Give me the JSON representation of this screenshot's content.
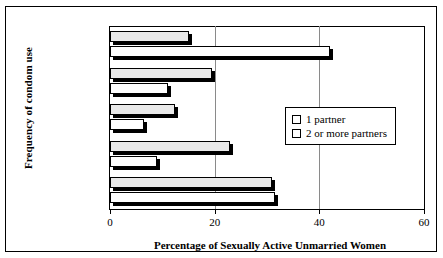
{
  "chart_data": {
    "type": "bar",
    "orientation": "horizontal",
    "title": "",
    "xlabel": "Percentage of Sexually Active Unmarried Women",
    "ylabel": "Frequency of condom use",
    "xlim": [
      0,
      60
    ],
    "xticks": [
      0,
      20,
      40,
      60
    ],
    "xtick_labels": [
      "0",
      "20",
      "40",
      "60"
    ],
    "grid": true,
    "legend_position": "right-middle",
    "categories": [
      "Not at all",
      "Less than\nhalf the time",
      "Half the time",
      "More than\nhalf the time",
      "Every time"
    ],
    "category_lines": [
      [
        "Not at all"
      ],
      [
        "Less than",
        "half the time"
      ],
      [
        "Half the time"
      ],
      [
        "More than",
        "half the time"
      ],
      [
        "Every time"
      ]
    ],
    "series": [
      {
        "name": "1 partner",
        "color": "#ffffff",
        "values": [
          42,
          11,
          6.5,
          9,
          31.5
        ]
      },
      {
        "name": "2 or more partners",
        "color": "#e9e9e9",
        "values": [
          15,
          19.5,
          12.5,
          23,
          31
        ]
      }
    ]
  },
  "legend": {
    "items": [
      {
        "label": "1 partner"
      },
      {
        "label": "2 or more partners"
      }
    ]
  },
  "axes": {
    "x_title": "Percentage of Sexually Active Unmarried Women",
    "y_title": "Frequency of condom use"
  },
  "colors": {
    "series_1_partner": "#ffffff",
    "series_2_or_more": "#e9e9e9",
    "outline": "#000000",
    "gridline": "#8a8a8a",
    "shadow": "#000000"
  }
}
